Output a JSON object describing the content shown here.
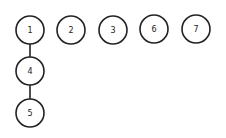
{
  "diagram": {
    "type": "tree",
    "stroke_color": "#222222",
    "fill_color": "#ffffff",
    "node_radius": 14,
    "nodes": [
      {
        "id": "1",
        "label": "1",
        "x": 30,
        "y": 30
      },
      {
        "id": "2",
        "label": "2",
        "x": 71,
        "y": 30
      },
      {
        "id": "3",
        "label": "3",
        "x": 113,
        "y": 30
      },
      {
        "id": "6",
        "label": "6",
        "x": 154,
        "y": 29
      },
      {
        "id": "7",
        "label": "7",
        "x": 196,
        "y": 29
      },
      {
        "id": "4",
        "label": "4",
        "x": 30,
        "y": 71
      },
      {
        "id": "5",
        "label": "5",
        "x": 30,
        "y": 113
      }
    ],
    "edges": [
      {
        "from": "1",
        "to": "4"
      },
      {
        "from": "4",
        "to": "5"
      }
    ]
  }
}
